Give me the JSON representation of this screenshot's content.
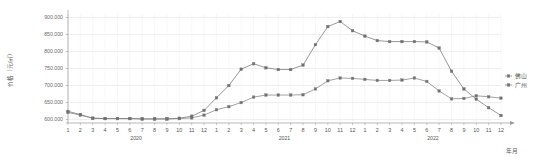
{
  "chart_data": {
    "type": "line",
    "title": "",
    "xlabel": "年月",
    "ylabel": "价格（元/㎡）",
    "ylim": [
      590000,
      910000
    ],
    "yticks": [
      600000,
      650000,
      700000,
      750000,
      800000,
      850000,
      900000
    ],
    "ytick_labels": [
      "600.000",
      "650.000",
      "700.000",
      "750.000",
      "800.000",
      "850.000",
      "900.000"
    ],
    "grid": true,
    "legend_position": "right",
    "x": [
      "1",
      "2",
      "3",
      "4",
      "5",
      "6",
      "7",
      "8",
      "9",
      "10",
      "11",
      "12",
      "1",
      "2",
      "3",
      "4",
      "5",
      "6",
      "7",
      "8",
      "9",
      "10",
      "11",
      "12",
      "1",
      "2",
      "3",
      "4",
      "5",
      "6",
      "7",
      "8",
      "9",
      "10",
      "11",
      "12"
    ],
    "year_groups": [
      {
        "label": "2020",
        "start_index": 0,
        "end_index": 11
      },
      {
        "label": "2021",
        "start_index": 12,
        "end_index": 23
      },
      {
        "label": "2022",
        "start_index": 24,
        "end_index": 35
      }
    ],
    "series": [
      {
        "name": "佛山",
        "color": "#8a8a8a",
        "values": [
          621000,
          613000,
          604000,
          603000,
          603000,
          603000,
          602000,
          602000,
          602000,
          603000,
          605000,
          613000,
          629000,
          638000,
          650000,
          666000,
          672000,
          672000,
          672000,
          673000,
          690000,
          714000,
          722000,
          721000,
          718000,
          715000,
          715000,
          716000,
          722000,
          712000,
          684000,
          661000,
          662000,
          670000,
          667000,
          663000
        ]
      },
      {
        "name": "广州",
        "color": "#7d7d7d",
        "values": [
          624000,
          615000,
          604000,
          603000,
          603000,
          603000,
          602000,
          602000,
          602000,
          604000,
          610000,
          627000,
          664000,
          700000,
          748000,
          764000,
          752000,
          747000,
          747000,
          760000,
          820000,
          873000,
          888000,
          861000,
          845000,
          832000,
          829000,
          829000,
          829000,
          828000,
          810000,
          742000,
          690000,
          660000,
          635000,
          612000
        ]
      }
    ]
  },
  "legend": {
    "items": [
      {
        "label": "佛山"
      },
      {
        "label": "广州"
      }
    ]
  },
  "axes": {
    "y_title": "价格（元/㎡）",
    "x_title": "年月"
  }
}
